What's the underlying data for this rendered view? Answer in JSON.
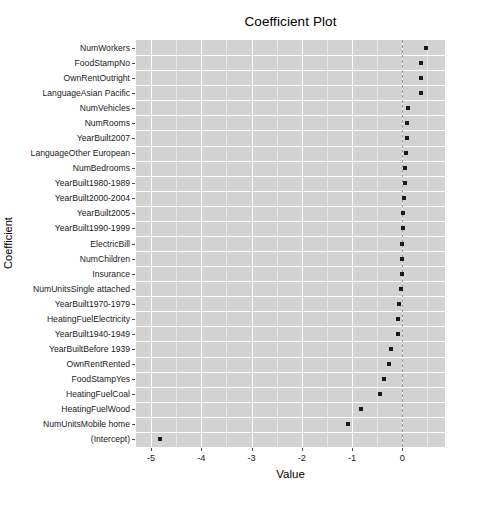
{
  "chart_data": {
    "type": "scatter",
    "title": "Coefficient Plot",
    "xlabel": "Value",
    "ylabel": "Coefficient",
    "xlim": [
      -5.3,
      0.85
    ],
    "xticks": [
      -5,
      -4,
      -3,
      -2,
      -1,
      0
    ],
    "xtick_labels": [
      "-5",
      "-4",
      "-3",
      "-2",
      "-1",
      "0"
    ],
    "grid": true,
    "legend": null,
    "reference_line": {
      "x": 0,
      "style": "dashed",
      "color": "#9a9a9a"
    },
    "panel_background": "#d2d2d2",
    "point_color": "#1a1a1a",
    "categories": [
      "NumWorkers",
      "FoodStampNo",
      "OwnRentOutright",
      "LanguageAsian Pacific",
      "NumVehicles",
      "NumRooms",
      "YearBuilt2007",
      "LanguageOther European",
      "NumBedrooms",
      "YearBuilt1980-1989",
      "YearBuilt2000-2004",
      "YearBuilt2005",
      "YearBuilt1990-1999",
      "ElectricBill",
      "NumChildren",
      "Insurance",
      "NumUnitsSingle attached",
      "YearBuilt1970-1979",
      "HeatingFuelElectricity",
      "YearBuilt1940-1949",
      "YearBuiltBefore 1939",
      "OwnRentRented",
      "FoodStampYes",
      "HeatingFuelCoal",
      "HeatingFuelWood",
      "NumUnitsMobile home",
      "(Intercept)"
    ],
    "values": [
      0.47,
      0.38,
      0.38,
      0.38,
      0.12,
      0.1,
      0.1,
      0.07,
      0.06,
      0.05,
      0.03,
      0.02,
      0.01,
      0.0,
      -0.01,
      -0.01,
      -0.02,
      -0.07,
      -0.08,
      -0.08,
      -0.23,
      -0.27,
      -0.37,
      -0.45,
      -0.82,
      -1.09,
      -4.83
    ]
  }
}
